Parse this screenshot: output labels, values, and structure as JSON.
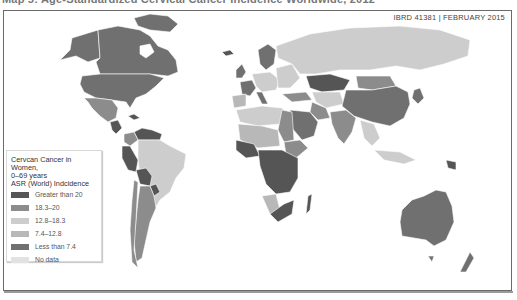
{
  "page": {
    "title_clipped": "Map 5: Age-Standardized Cervical Cancer Incidence Worldwide, 2012"
  },
  "map": {
    "reference": "IBRD 41381  |  FEBRUARY 2015",
    "type": "choropleth",
    "subject": "Cervical cancer incidence in women, 0-69 years, ASR (World)"
  },
  "legend": {
    "title_line1": "Cervcan Cancer in Women,",
    "title_line2": "0–69 years",
    "title_line3": "ASR (World) Indcidence",
    "items": [
      {
        "label": "Greater than 20",
        "color": "#555555"
      },
      {
        "label": "18.3–20",
        "color": "#8c8c8c"
      },
      {
        "label": "12.8–18.3",
        "color": "#cdcdcd"
      },
      {
        "label": "7.4–12.8",
        "color": "#b8b8b8"
      },
      {
        "label": "Less than 7.4",
        "color": "#707070"
      },
      {
        "label": "No data",
        "color": "#e2e2e2"
      }
    ]
  },
  "colors": {
    "gt20": "#555555",
    "c18": "#8c8c8c",
    "c12": "#cdcdcd",
    "c7": "#b8b8b8",
    "lt7": "#707070",
    "nodata": "#e2e2e2",
    "frame": "#6a6a6a"
  }
}
